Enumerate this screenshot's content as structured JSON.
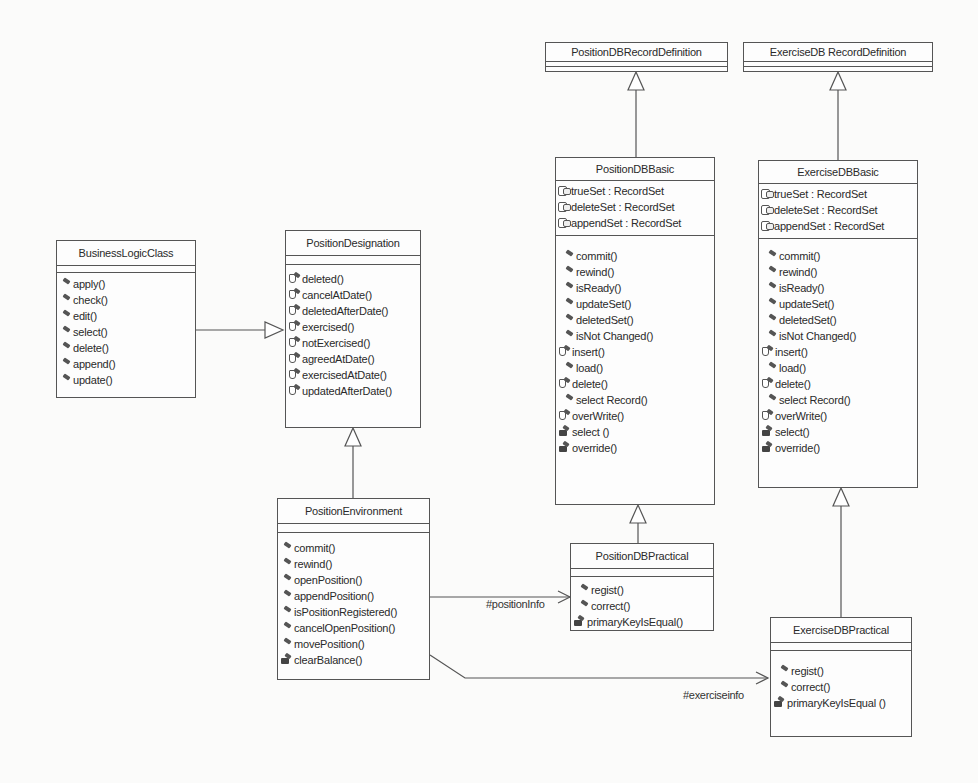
{
  "diagram": {
    "type": "UML class diagram",
    "classes": {
      "business_logic": {
        "name": "BusinessLogicClass",
        "attributes": [],
        "operations": [
          {
            "label": "apply()",
            "visibility": "public"
          },
          {
            "label": "check()",
            "visibility": "public"
          },
          {
            "label": "edit()",
            "visibility": "public"
          },
          {
            "label": "select()",
            "visibility": "public"
          },
          {
            "label": "delete()",
            "visibility": "public"
          },
          {
            "label": "append()",
            "visibility": "public"
          },
          {
            "label": "update()",
            "visibility": "public"
          }
        ]
      },
      "position_designation": {
        "name": "PositionDesignation",
        "attributes": [],
        "operations": [
          {
            "label": "deleted()",
            "visibility": "protected"
          },
          {
            "label": "cancelAtDate()",
            "visibility": "protected"
          },
          {
            "label": "deletedAfterDate()",
            "visibility": "protected"
          },
          {
            "label": "exercised()",
            "visibility": "protected"
          },
          {
            "label": "notExercised()",
            "visibility": "protected"
          },
          {
            "label": "agreedAtDate()",
            "visibility": "protected"
          },
          {
            "label": "exercisedAtDate()",
            "visibility": "protected"
          },
          {
            "label": "updatedAfterDate()",
            "visibility": "protected"
          }
        ]
      },
      "position_environment": {
        "name": "PositionEnvironment",
        "attributes": [],
        "operations": [
          {
            "label": "commit()",
            "visibility": "public"
          },
          {
            "label": "rewind()",
            "visibility": "public"
          },
          {
            "label": "openPosition()",
            "visibility": "public"
          },
          {
            "label": "appendPosition()",
            "visibility": "public"
          },
          {
            "label": "isPositionRegistered()",
            "visibility": "public"
          },
          {
            "label": "cancelOpenPosition()",
            "visibility": "public"
          },
          {
            "label": "movePosition()",
            "visibility": "public"
          },
          {
            "label": "clearBalance()",
            "visibility": "private"
          }
        ]
      },
      "position_db_record_definition": {
        "name": "PositionDBRecordDefinition",
        "attributes": [],
        "operations": []
      },
      "exercise_db_record_definition": {
        "name": "ExerciseDB RecordDefinition",
        "attributes": [],
        "operations": []
      },
      "position_db_basic": {
        "name": "PositionDBBasic",
        "attributes": [
          {
            "label": "trueSet : RecordSet"
          },
          {
            "label": "deleteSet : RecordSet"
          },
          {
            "label": "appendSet : RecordSet"
          }
        ],
        "operations": [
          {
            "label": "commit()",
            "visibility": "public"
          },
          {
            "label": "rewind()",
            "visibility": "public"
          },
          {
            "label": "isReady()",
            "visibility": "public"
          },
          {
            "label": "updateSet()",
            "visibility": "public"
          },
          {
            "label": "deletedSet()",
            "visibility": "public"
          },
          {
            "label": "isNot Changed()",
            "visibility": "public"
          },
          {
            "label": "insert()",
            "visibility": "protected"
          },
          {
            "label": "load()",
            "visibility": "public"
          },
          {
            "label": "delete()",
            "visibility": "protected"
          },
          {
            "label": "select Record()",
            "visibility": "public"
          },
          {
            "label": "overWrite()",
            "visibility": "protected"
          },
          {
            "label": "select ()",
            "visibility": "private"
          },
          {
            "label": "override()",
            "visibility": "private"
          }
        ]
      },
      "exercise_db_basic": {
        "name": "ExerciseDBBasic",
        "attributes": [
          {
            "label": "trueSet : RecordSet"
          },
          {
            "label": "deleteSet : RecordSet"
          },
          {
            "label": "appendSet : RecordSet"
          }
        ],
        "operations": [
          {
            "label": "commit()",
            "visibility": "public"
          },
          {
            "label": "rewind()",
            "visibility": "public"
          },
          {
            "label": "isReady()",
            "visibility": "public"
          },
          {
            "label": "updateSet()",
            "visibility": "public"
          },
          {
            "label": "deletedSet()",
            "visibility": "public"
          },
          {
            "label": "isNot Changed()",
            "visibility": "public"
          },
          {
            "label": "insert()",
            "visibility": "protected"
          },
          {
            "label": "load()",
            "visibility": "public"
          },
          {
            "label": "delete()",
            "visibility": "protected"
          },
          {
            "label": "select Record()",
            "visibility": "public"
          },
          {
            "label": "overWrite()",
            "visibility": "protected"
          },
          {
            "label": "select()",
            "visibility": "private"
          },
          {
            "label": "override()",
            "visibility": "private"
          }
        ]
      },
      "position_db_practical": {
        "name": "PositionDBPractical",
        "attributes": [],
        "operations": [
          {
            "label": "regist()",
            "visibility": "public"
          },
          {
            "label": "correct()",
            "visibility": "public"
          },
          {
            "label": "primaryKeyIsEqual()",
            "visibility": "private"
          }
        ]
      },
      "exercise_db_practical": {
        "name": "ExerciseDBPractical",
        "attributes": [],
        "operations": [
          {
            "label": "regist()",
            "visibility": "public"
          },
          {
            "label": "correct()",
            "visibility": "public"
          },
          {
            "label": "primaryKeyIsEqual ()",
            "visibility": "private"
          }
        ]
      }
    },
    "relations": [
      {
        "type": "generalization",
        "from": "BusinessLogicClass",
        "to": "PositionDesignation"
      },
      {
        "type": "generalization",
        "from": "PositionEnvironment",
        "to": "PositionDesignation"
      },
      {
        "type": "generalization",
        "from": "PositionDBBasic",
        "to": "PositionDBRecordDefinition"
      },
      {
        "type": "generalization",
        "from": "PositionDBPractical",
        "to": "PositionDBBasic"
      },
      {
        "type": "generalization",
        "from": "ExerciseDBBasic",
        "to": "ExerciseDB RecordDefinition"
      },
      {
        "type": "generalization",
        "from": "ExerciseDBPractical",
        "to": "ExerciseDBBasic"
      },
      {
        "type": "association",
        "from": "PositionEnvironment",
        "to": "PositionDBPractical",
        "role": "#positionInfo"
      },
      {
        "type": "association",
        "from": "PositionEnvironment",
        "to": "ExerciseDBPractical",
        "role": "#exerciseinfo"
      }
    ],
    "role_labels": {
      "position_info": "#positionInfo",
      "exercise_info": "#exerciseinfo"
    }
  }
}
